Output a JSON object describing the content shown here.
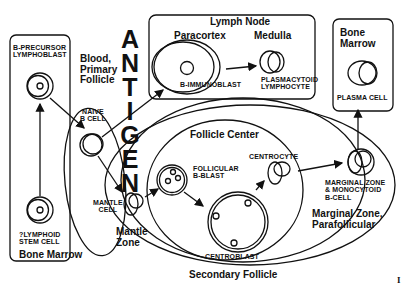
{
  "diagram": {
    "type": "B-cell differentiation pathway",
    "antigen_label": [
      "A",
      "N",
      "T",
      "I",
      "G",
      "E",
      "N"
    ],
    "regions": {
      "bone_marrow_left": "Bone Marrow",
      "blood_primary_follicle": [
        "Blood,",
        "Primary",
        "Follicle"
      ],
      "lymph_node": "Lymph Node",
      "paracortex": "Paracortex",
      "medulla": "Medulla",
      "bone_marrow_right": [
        "Bone",
        "Marrow"
      ],
      "follicle_center": "Follicle Center",
      "mantle_zone": [
        "Mantle",
        "Zone"
      ],
      "marginal_zone": [
        "Marginal Zone,",
        "Parafollicular"
      ],
      "secondary_follicle": "Secondary Follicle"
    },
    "cells": {
      "b_precursor": [
        "B-PRECURSOR",
        "LYMPHOBLAST"
      ],
      "lymphoid_stem": [
        "?LYMPHOID",
        "STEM CELL"
      ],
      "naive_b": [
        "NAIVE",
        "B CELL"
      ],
      "b_immunoblast": "B-IMMUNOBLAST",
      "plasmacytoid": [
        "PLASMACYTOID",
        "LYMPHOCYTE"
      ],
      "plasma_cell": "PLASMA CELL",
      "mantle_cell": [
        "MANTLE",
        "CELL"
      ],
      "follicular_b_blast": [
        "FOLLICULAR",
        "B-BLAST"
      ],
      "centrocyte": "CENTROCYTE",
      "centroblast": "CENTROBLAST",
      "marginal_zone_cell": [
        "MARGINAL ZONE",
        "& MONOCYTOID",
        "B-CELL"
      ]
    },
    "corner_mark": "I",
    "line_color": "#111111",
    "background": "#ffffff"
  }
}
